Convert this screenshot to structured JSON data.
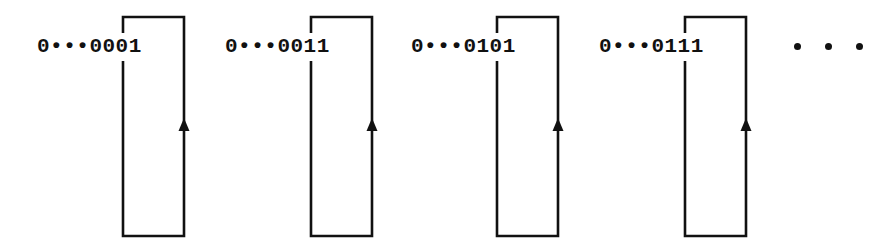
{
  "figure": {
    "type": "state-transition-diagram",
    "background_color": "#ffffff",
    "stroke_color": "#111111",
    "text_color": "#111111"
  },
  "states": [
    {
      "label": "0•••0001",
      "label_x": 40,
      "loop_left": 122,
      "loop_right": 185,
      "loop_top": 16,
      "loop_bottom": 237,
      "arrow_direction": "up",
      "arrow_y": 128
    },
    {
      "label": "0•••0011",
      "label_x": 228,
      "loop_left": 310,
      "loop_right": 373,
      "loop_top": 16,
      "loop_bottom": 237,
      "arrow_direction": "up",
      "arrow_y": 128
    },
    {
      "label": "0•••0101",
      "label_x": 414,
      "loop_left": 496,
      "loop_right": 560,
      "loop_top": 16,
      "loop_bottom": 237,
      "arrow_direction": "up",
      "arrow_y": 128
    },
    {
      "label": "0•••0111",
      "label_x": 602,
      "loop_left": 684,
      "loop_right": 749,
      "loop_top": 16,
      "loop_bottom": 237,
      "arrow_direction": "up",
      "arrow_y": 128
    }
  ],
  "trailing_ellipsis": {
    "dot_count": 3,
    "x": 794,
    "y": 43
  }
}
